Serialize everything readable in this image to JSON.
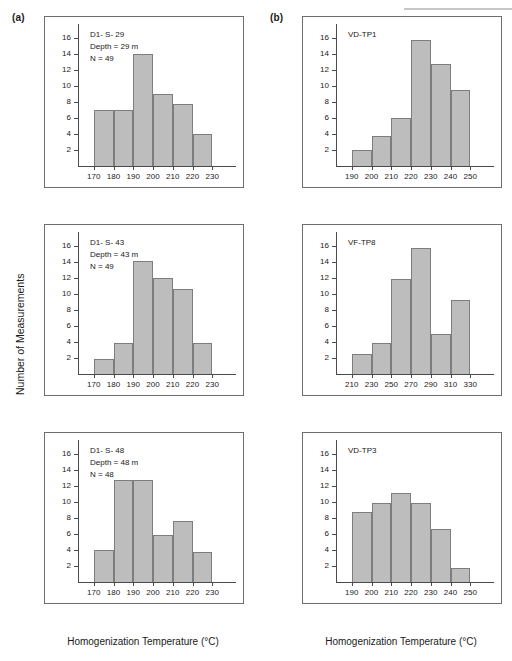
{
  "figure": {
    "panel_a_label": "(a)",
    "panel_b_label": "(b)",
    "axis_title_x": "Homogenization Temperature (°C)",
    "axis_title_y": "Number of Measurements",
    "bar_color": "#bdbdbd",
    "bar_edge_color": "#7d7d7d",
    "axis_color": "#4a4a4a"
  },
  "chart_data": [
    {
      "id": "d1-s-29",
      "type": "bar",
      "panel": "(a)",
      "title": "D1- S- 29",
      "annotations": [
        "D1- S- 29",
        "Depth = 29 m",
        "N = 49"
      ],
      "xlabel": "Homogenization Temperature (°C)",
      "ylabel": "Number of Measurements",
      "xticks": [
        170,
        180,
        190,
        200,
        210,
        220,
        230
      ],
      "yticks": [
        2,
        4,
        6,
        8,
        10,
        12,
        14,
        16
      ],
      "xlim": [
        162,
        242
      ],
      "ylim": [
        0,
        17.5
      ],
      "bin_edges": [
        170,
        180,
        190,
        200,
        210,
        220,
        230
      ],
      "categories": [
        "170-180",
        "180-190",
        "190-200",
        "200-210",
        "210-220",
        "220-230"
      ],
      "values": [
        7,
        7,
        14,
        9,
        7.7,
        4
      ],
      "grid": false,
      "legend": "none"
    },
    {
      "id": "vd-tp1",
      "type": "bar",
      "panel": "(b)",
      "title": "VD-TP1",
      "annotations": [
        "VD-TP1"
      ],
      "xlabel": "Homogenization Temperature (°C)",
      "ylabel": "Number of Measurements",
      "xticks": [
        190,
        200,
        210,
        220,
        230,
        240,
        250
      ],
      "yticks": [
        2,
        4,
        6,
        8,
        10,
        12,
        14,
        16
      ],
      "xlim": [
        182,
        262
      ],
      "ylim": [
        0,
        17.5
      ],
      "bin_edges": [
        190,
        200,
        210,
        220,
        230,
        240,
        250
      ],
      "categories": [
        "190-200",
        "200-210",
        "210-220",
        "220-230",
        "230-240",
        "240-250"
      ],
      "values": [
        2,
        3.8,
        6,
        15.8,
        12.7,
        9.5
      ],
      "grid": false,
      "legend": "none"
    },
    {
      "id": "d1-s-43",
      "type": "bar",
      "panel": "(a)",
      "title": "D1- S- 43",
      "annotations": [
        "D1- S- 43",
        "Depth = 43 m",
        "N = 49"
      ],
      "xlabel": "Homogenization Temperature (°C)",
      "ylabel": "Number of Measurements",
      "xticks": [
        170,
        180,
        190,
        200,
        210,
        220,
        230
      ],
      "yticks": [
        2,
        4,
        6,
        8,
        10,
        12,
        14,
        16
      ],
      "xlim": [
        162,
        242
      ],
      "ylim": [
        0,
        17.5
      ],
      "bin_edges": [
        170,
        180,
        190,
        200,
        210,
        220,
        230
      ],
      "categories": [
        "170-180",
        "180-190",
        "190-200",
        "200-210",
        "210-220",
        "220-230"
      ],
      "values": [
        1.9,
        3.9,
        14.1,
        12,
        10.6,
        3.9
      ],
      "grid": false,
      "legend": "none"
    },
    {
      "id": "vf-tp8",
      "type": "bar",
      "panel": "(b)",
      "title": "VF-TP8",
      "annotations": [
        "VF-TP8"
      ],
      "xlabel": "Homogenization Temperature (°C)",
      "ylabel": "Number of Measurements",
      "xticks": [
        210,
        230,
        250,
        270,
        290,
        310,
        330
      ],
      "yticks": [
        2,
        4,
        6,
        8,
        10,
        12,
        14,
        16
      ],
      "xlim": [
        194,
        354
      ],
      "ylim": [
        0,
        17.5
      ],
      "bin_edges": [
        210,
        230,
        250,
        270,
        290,
        310,
        330
      ],
      "categories": [
        "210-230",
        "230-250",
        "250-270",
        "270-290",
        "290-310",
        "310-330"
      ],
      "values": [
        2.5,
        3.9,
        11.9,
        15.7,
        5,
        9.3
      ],
      "grid": false,
      "legend": "none"
    },
    {
      "id": "d1-s-48",
      "type": "bar",
      "panel": "(a)",
      "title": "D1- S- 48",
      "annotations": [
        "D1- S- 48",
        "Depth = 48 m",
        "N = 48"
      ],
      "xlabel": "Homogenization Temperature (°C)",
      "ylabel": "Number of Measurements",
      "xticks": [
        170,
        180,
        190,
        200,
        210,
        220,
        230
      ],
      "yticks": [
        2,
        4,
        6,
        8,
        10,
        12,
        14,
        16
      ],
      "xlim": [
        162,
        242
      ],
      "ylim": [
        0,
        17.5
      ],
      "bin_edges": [
        170,
        180,
        190,
        200,
        210,
        220,
        230
      ],
      "categories": [
        "170-180",
        "180-190",
        "190-200",
        "200-210",
        "210-220",
        "220-230"
      ],
      "values": [
        4,
        12.7,
        12.7,
        5.9,
        7.6,
        3.8
      ],
      "grid": false,
      "legend": "none"
    },
    {
      "id": "vd-tp3",
      "type": "bar",
      "panel": "(b)",
      "title": "VD-TP3",
      "annotations": [
        "VD-TP3"
      ],
      "xlabel": "Homogenization Temperature (°C)",
      "ylabel": "Number of Measurements",
      "xticks": [
        190,
        200,
        210,
        220,
        230,
        240,
        250
      ],
      "yticks": [
        2,
        4,
        6,
        8,
        10,
        12,
        14,
        16
      ],
      "xlim": [
        182,
        262
      ],
      "ylim": [
        0,
        17.5
      ],
      "bin_edges": [
        190,
        200,
        210,
        220,
        230,
        240,
        250
      ],
      "categories": [
        "190-200",
        "200-210",
        "210-220",
        "220-230",
        "230-240",
        "240-250"
      ],
      "values": [
        8.8,
        9.9,
        11.1,
        9.9,
        6.6,
        1.8
      ],
      "grid": false,
      "legend": "none"
    }
  ]
}
